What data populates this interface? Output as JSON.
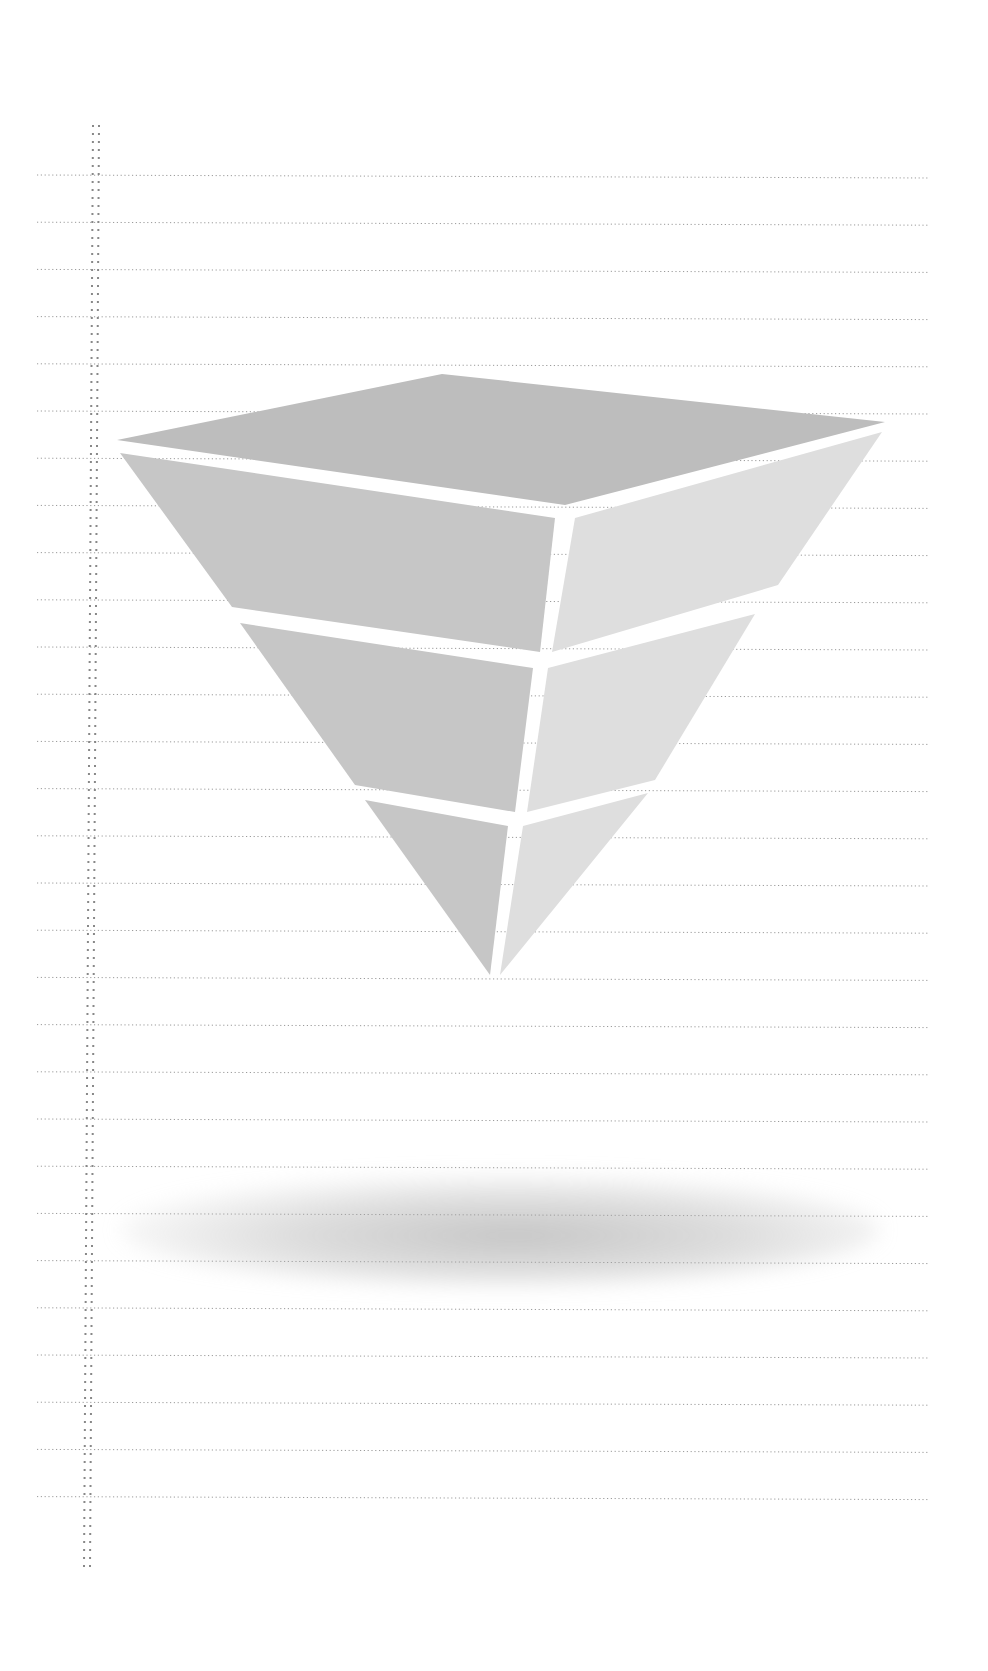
{
  "page": {
    "background": "#ffffff",
    "ruled_lines": {
      "count": 29,
      "first_y": 175,
      "spacing": 47.2,
      "x_start": 37,
      "x_end": 930,
      "style": "dotted",
      "color": "#9a9a9a"
    },
    "margin_rule": {
      "style": "double-dotted",
      "x_top": 93,
      "x_bottom": 84,
      "y_start": 125,
      "y_end": 1568,
      "color": "#888888"
    }
  },
  "figure": {
    "type": "inverted-pyramid",
    "band_count": 3,
    "colors": {
      "top_face": "#bdbdbd",
      "left_face": "#c6c6c6",
      "right_face": "#dedede",
      "gap": "#ffffff",
      "shadow": "#b5b5b5"
    },
    "top_face": {
      "points": [
        [
          117,
          440
        ],
        [
          442,
          374
        ],
        [
          885,
          422
        ],
        [
          565,
          505
        ]
      ]
    },
    "bands": [
      {
        "name": "band-1",
        "left_face": [
          [
            120,
            453
          ],
          [
            555,
            518
          ],
          [
            540,
            652
          ],
          [
            232,
            607
          ]
        ],
        "right_face": [
          [
            575,
            518
          ],
          [
            882,
            432
          ],
          [
            778,
            585
          ],
          [
            552,
            652
          ]
        ]
      },
      {
        "name": "band-2",
        "left_face": [
          [
            240,
            623
          ],
          [
            533,
            668
          ],
          [
            515,
            812
          ],
          [
            355,
            785
          ]
        ],
        "right_face": [
          [
            548,
            668
          ],
          [
            755,
            614
          ],
          [
            655,
            780
          ],
          [
            527,
            812
          ]
        ]
      },
      {
        "name": "band-3",
        "left_face": [
          [
            365,
            800
          ],
          [
            508,
            826
          ],
          [
            490,
            975
          ]
        ],
        "right_face": [
          [
            523,
            826
          ],
          [
            648,
            793
          ],
          [
            500,
            975
          ]
        ]
      }
    ],
    "shadow": {
      "cx": 500,
      "cy": 1230,
      "rx": 380,
      "ry": 55
    }
  }
}
